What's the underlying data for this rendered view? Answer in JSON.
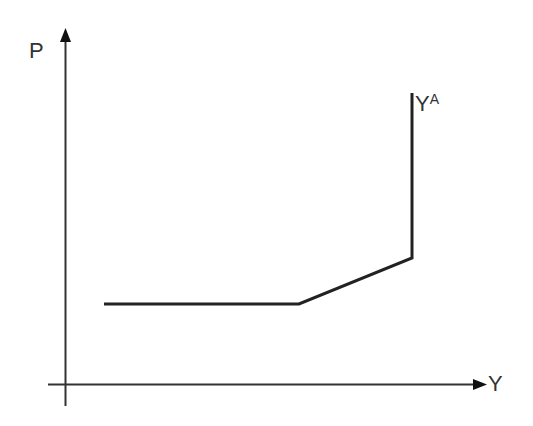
{
  "diagram": {
    "type": "supply-curve",
    "axes": {
      "y_label": "P",
      "x_label": "Y"
    },
    "curve_label": {
      "base": "Y",
      "superscript": "A"
    },
    "curve_points": [
      [
        104,
        304
      ],
      [
        299,
        304
      ],
      [
        412,
        258
      ],
      [
        412,
        93
      ]
    ],
    "colors": {
      "line": "#222222",
      "axis": "#333333",
      "text": "#333333"
    }
  }
}
